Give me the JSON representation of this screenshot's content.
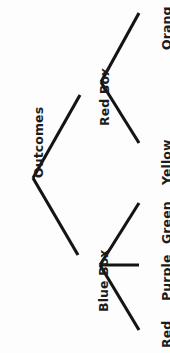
{
  "diagram": {
    "type": "tree-diagram",
    "orientation": "rotated-90-counterclockwise",
    "root": {
      "id": "outcomes",
      "label": "Outcomes"
    },
    "branches": [
      {
        "id": "red-box",
        "label": "Red Box",
        "leaves": [
          {
            "id": "orange",
            "label": "Orang"
          },
          {
            "id": "yellow",
            "label": "Yellow"
          }
        ]
      },
      {
        "id": "blue-box",
        "label": "Blue Box",
        "leaves": [
          {
            "id": "green",
            "label": "Green"
          },
          {
            "id": "purple",
            "label": "Purple"
          },
          {
            "id": "red",
            "label": "Red"
          }
        ]
      }
    ],
    "colors": {
      "background": "#fdfdfd",
      "stroke": "#141414",
      "text": "#1c1c1c"
    },
    "geometry": {
      "root_vertex": {
        "x": 33,
        "y": 178
      },
      "red_box_vertex": {
        "x": 101,
        "y": 82
      },
      "blue_box_vertex": {
        "x": 100,
        "y": 265
      },
      "edges": [
        {
          "from": "root",
          "to": "red-box",
          "x1": 33,
          "y1": 178,
          "x2": 80,
          "y2": 95
        },
        {
          "from": "root",
          "to": "blue-box",
          "x1": 33,
          "y1": 178,
          "x2": 78,
          "y2": 255
        },
        {
          "from": "red-box",
          "to": "orange",
          "x1": 101,
          "y1": 82,
          "x2": 139,
          "y2": 13
        },
        {
          "from": "red-box",
          "to": "yellow",
          "x1": 101,
          "y1": 82,
          "x2": 139,
          "y2": 143
        },
        {
          "from": "blue-box",
          "to": "green",
          "x1": 100,
          "y1": 265,
          "x2": 139,
          "y2": 203
        },
        {
          "from": "blue-box",
          "to": "purple",
          "x1": 100,
          "y1": 265,
          "x2": 139,
          "y2": 265
        },
        {
          "from": "blue-box",
          "to": "red",
          "x1": 100,
          "y1": 265,
          "x2": 139,
          "y2": 330
        }
      ],
      "labels": [
        {
          "id": "outcomes",
          "left": 33,
          "top": 178
        },
        {
          "id": "red-box",
          "left": 99,
          "top": 126
        },
        {
          "id": "blue-box",
          "left": 98,
          "top": 312
        },
        {
          "id": "orange",
          "left": 161,
          "top": 50
        },
        {
          "id": "yellow",
          "left": 161,
          "top": 185
        },
        {
          "id": "green",
          "left": 161,
          "top": 244
        },
        {
          "id": "purple",
          "left": 161,
          "top": 301
        },
        {
          "id": "red",
          "left": 161,
          "top": 348
        }
      ]
    }
  }
}
